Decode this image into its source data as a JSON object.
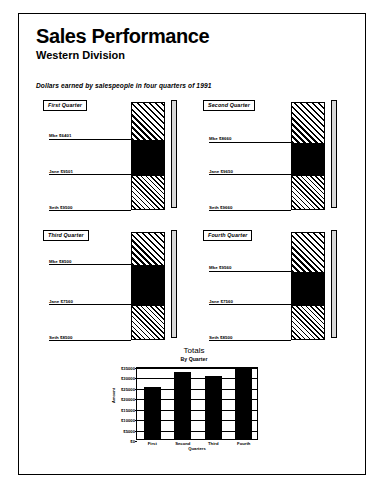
{
  "document": {
    "title": "Sales Performance",
    "subtitle": "Western Division",
    "caption": "Dollars earned by salespeople in four quarters of 1991"
  },
  "quarters": [
    {
      "tag": "First Quarter",
      "segments": [
        {
          "name": "Mke",
          "value": "$6401",
          "fill": "hatch-dark",
          "height_pct": 34
        },
        {
          "name": "Jane",
          "value": "$9501",
          "fill": "solid",
          "height_pct": 33
        },
        {
          "name": "Seth",
          "value": "$9500",
          "fill": "hatch-light",
          "height_pct": 33
        }
      ]
    },
    {
      "tag": "Second Quarter",
      "segments": [
        {
          "name": "Mke",
          "value": "$8660",
          "fill": "hatch-dark",
          "height_pct": 37
        },
        {
          "name": "Jane",
          "value": "$9650",
          "fill": "solid",
          "height_pct": 30
        },
        {
          "name": "Seth",
          "value": "$9660",
          "fill": "hatch-light",
          "height_pct": 33
        }
      ]
    },
    {
      "tag": "Third Quarter",
      "segments": [
        {
          "name": "Mke",
          "value": "$8500",
          "fill": "hatch-dark",
          "height_pct": 30
        },
        {
          "name": "Jane",
          "value": "$7560",
          "fill": "solid",
          "height_pct": 37
        },
        {
          "name": "Seth",
          "value": "$8500",
          "fill": "hatch-light",
          "height_pct": 33
        }
      ]
    },
    {
      "tag": "Fourth Quarter",
      "segments": [
        {
          "name": "Mke",
          "value": "$9560",
          "fill": "hatch-dark",
          "height_pct": 36
        },
        {
          "name": "Jane",
          "value": "$7560",
          "fill": "solid",
          "height_pct": 31
        },
        {
          "name": "Seth",
          "value": "$8500",
          "fill": "hatch-light",
          "height_pct": 33
        }
      ]
    }
  ],
  "chart_data": {
    "type": "bar",
    "title": "Totals",
    "subtitle": "By Quarter",
    "xlabel": "Quarters",
    "ylabel": "Amount",
    "categories": [
      "First",
      "Second",
      "Third",
      "Fourth"
    ],
    "values": [
      25000,
      32000,
      30000,
      34000
    ],
    "ylim": [
      0,
      35000
    ],
    "yticks": [
      0,
      5000,
      10000,
      15000,
      20000,
      25000,
      30000,
      35000
    ],
    "ytick_labels": [
      "$0",
      "$5000",
      "$10000",
      "$15000",
      "$20000",
      "$25000",
      "$30000",
      "$35000"
    ],
    "grid": true,
    "legend": false
  }
}
